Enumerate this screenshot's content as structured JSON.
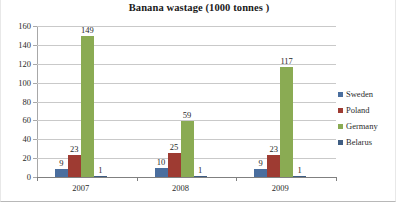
{
  "chart_data": {
    "type": "bar",
    "title": "Banana wastage (1000 tonnes )",
    "xlabel": "",
    "ylabel": "",
    "categories": [
      "2007",
      "2008",
      "2009"
    ],
    "series": [
      {
        "name": "Sweden",
        "color": "#4a6e9e",
        "values": [
          9,
          10,
          9
        ]
      },
      {
        "name": "Poland",
        "color": "#9e3b32",
        "values": [
          23,
          25,
          23
        ]
      },
      {
        "name": "Germany",
        "color": "#8aab53",
        "values": [
          149,
          59,
          117
        ]
      },
      {
        "name": "Belarus",
        "color": "#3f5d82",
        "values": [
          1,
          1,
          1
        ]
      }
    ],
    "ylim": [
      0,
      160
    ],
    "yticks": [
      0,
      20,
      40,
      60,
      80,
      100,
      120,
      140,
      160
    ],
    "ytick_labels": [
      "0",
      "20",
      "40",
      "60",
      "80",
      "100",
      "120",
      "140",
      "160"
    ],
    "grid": true,
    "legend_position": "right",
    "data_labels": true
  }
}
